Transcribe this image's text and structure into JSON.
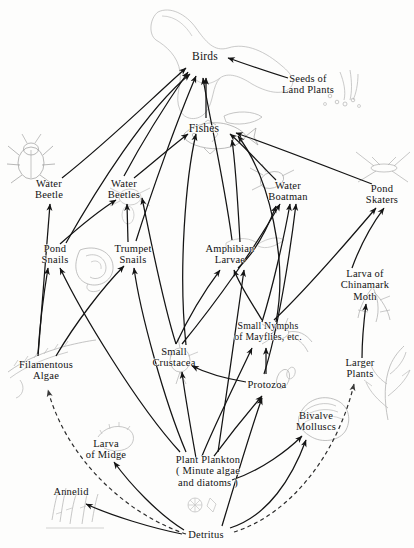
{
  "figure": {
    "background_color": "#fdfdfc",
    "ink_color": "#131313",
    "width": 414,
    "height": 548
  },
  "nodes": [
    {
      "id": "birds",
      "label": "Birds",
      "x": 205,
      "y": 56,
      "size": "lg"
    },
    {
      "id": "seeds",
      "label": "Seeds of\nLand Plants",
      "x": 308,
      "y": 84,
      "size": "md"
    },
    {
      "id": "fishes",
      "label": "Fishes",
      "x": 204,
      "y": 128,
      "size": "lg"
    },
    {
      "id": "water-beetle",
      "label": "Water\nBeetle",
      "x": 49,
      "y": 189,
      "size": "md"
    },
    {
      "id": "water-beetles",
      "label": "Water\nBeetles",
      "x": 124,
      "y": 189,
      "size": "md"
    },
    {
      "id": "water-boatman",
      "label": "Water\nBoatman",
      "x": 288,
      "y": 191,
      "size": "md"
    },
    {
      "id": "pond-skaters",
      "label": "Pond\nSkaters",
      "x": 382,
      "y": 194,
      "size": "md"
    },
    {
      "id": "pond-snails",
      "label": "Pond\nSnails",
      "x": 55,
      "y": 254,
      "size": "md"
    },
    {
      "id": "trumpet-snails",
      "label": "Trumpet\nSnails",
      "x": 133,
      "y": 254,
      "size": "md"
    },
    {
      "id": "amphibian-larvae",
      "label": "Amphibian\nLarvae",
      "x": 230,
      "y": 254,
      "size": "md"
    },
    {
      "id": "chinamark-moth",
      "label": "Larva of\nChinamark\nMoth",
      "x": 365,
      "y": 285,
      "size": "md"
    },
    {
      "id": "mayfly-nymphs",
      "label": "Small Nymphs\nof Mayflies, etc.",
      "x": 268,
      "y": 332,
      "size": "sm"
    },
    {
      "id": "filamentous-algae",
      "label": "Filamentous\nAlgae",
      "x": 46,
      "y": 370,
      "size": "md"
    },
    {
      "id": "small-crustacea",
      "label": "Small\nCrustacea",
      "x": 174,
      "y": 357,
      "size": "md"
    },
    {
      "id": "protozoa",
      "label": "Protozoa",
      "x": 267,
      "y": 385,
      "size": "md"
    },
    {
      "id": "larger-plants",
      "label": "Larger Plants",
      "x": 360,
      "y": 368,
      "size": "md"
    },
    {
      "id": "bivalve-molluscs",
      "label": "Bivalve\nMolluscs",
      "x": 316,
      "y": 421,
      "size": "md"
    },
    {
      "id": "larva-of-midge",
      "label": "Larva\nof Midge",
      "x": 106,
      "y": 449,
      "size": "md"
    },
    {
      "id": "plant-plankton",
      "label": "Plant Plankton\n( Minute algae\nand diatoms )",
      "x": 208,
      "y": 471,
      "size": "md"
    },
    {
      "id": "annelid",
      "label": "Annelid",
      "x": 71,
      "y": 492,
      "size": "md"
    },
    {
      "id": "detritus",
      "label": "Detritus",
      "x": 206,
      "y": 535,
      "size": "md"
    }
  ],
  "illustrations": [
    {
      "id": "bird-illustration",
      "name": "flying-bird-drawing",
      "x": 212,
      "y": 55
    },
    {
      "id": "seeds-illustration",
      "name": "seeds-drawing",
      "x": 344,
      "y": 92
    },
    {
      "id": "fish-illustration",
      "name": "fish-drawing",
      "x": 212,
      "y": 133
    },
    {
      "id": "water-beetle-illustration",
      "name": "beetle-drawing",
      "x": 31,
      "y": 160
    },
    {
      "id": "water-beetles-illustration",
      "name": "beetle-drawing",
      "x": 130,
      "y": 196
    },
    {
      "id": "water-boatman-illustration",
      "name": "water-boatman-drawing",
      "x": 273,
      "y": 180
    },
    {
      "id": "pond-skater-illustration",
      "name": "pond-skater-drawing",
      "x": 383,
      "y": 166
    },
    {
      "id": "snail-illustration",
      "name": "snail-shell-drawing",
      "x": 95,
      "y": 262
    },
    {
      "id": "amphibian-illustration",
      "name": "tadpole-drawing",
      "x": 243,
      "y": 245
    },
    {
      "id": "chinamark-illustration",
      "name": "moth-larva-drawing",
      "x": 372,
      "y": 300
    },
    {
      "id": "mayfly-illustration",
      "name": "mayfly-nymph-drawing",
      "x": 282,
      "y": 334
    },
    {
      "id": "algae-illustration",
      "name": "filamentous-algae-drawing",
      "x": 50,
      "y": 362
    },
    {
      "id": "crustacea-illustration",
      "name": "water-flea-drawing",
      "x": 180,
      "y": 362
    },
    {
      "id": "protozoa-illustration",
      "name": "protozoa-drawing",
      "x": 283,
      "y": 380
    },
    {
      "id": "larger-plants-illustration",
      "name": "pondweed-drawing",
      "x": 385,
      "y": 388
    },
    {
      "id": "mollusc-illustration",
      "name": "bivalve-shell-drawing",
      "x": 323,
      "y": 416
    },
    {
      "id": "midge-illustration",
      "name": "midge-larva-drawing",
      "x": 114,
      "y": 435
    },
    {
      "id": "diatom-illustration",
      "name": "diatom-drawing",
      "x": 197,
      "y": 505
    },
    {
      "id": "annelid-illustration",
      "name": "worm-tubes-drawing",
      "x": 73,
      "y": 512
    }
  ],
  "links": [
    {
      "from": "water-beetle",
      "to": "birds",
      "style": "solid"
    },
    {
      "from": "water-beetles",
      "to": "birds",
      "style": "solid"
    },
    {
      "from": "pond-snails",
      "to": "birds",
      "style": "solid"
    },
    {
      "from": "trumpet-snails",
      "to": "birds",
      "style": "solid"
    },
    {
      "from": "amphibian-larvae",
      "to": "birds",
      "style": "solid"
    },
    {
      "from": "fishes",
      "to": "birds",
      "style": "solid"
    },
    {
      "from": "seeds",
      "to": "birds",
      "style": "solid"
    },
    {
      "from": "water-beetles",
      "to": "fishes",
      "style": "solid"
    },
    {
      "from": "water-boatman",
      "to": "fishes",
      "style": "solid"
    },
    {
      "from": "pond-skaters",
      "to": "fishes",
      "style": "solid"
    },
    {
      "from": "amphibian-larvae",
      "to": "fishes",
      "style": "solid"
    },
    {
      "from": "mayfly-nymphs",
      "to": "fishes",
      "style": "solid"
    },
    {
      "from": "small-crustacea",
      "to": "fishes",
      "style": "solid"
    },
    {
      "from": "filamentous-algae",
      "to": "water-beetle",
      "style": "solid"
    },
    {
      "from": "pond-snails",
      "to": "water-beetles",
      "style": "solid"
    },
    {
      "from": "trumpet-snails",
      "to": "water-beetles",
      "style": "solid"
    },
    {
      "from": "small-crustacea",
      "to": "water-beetles",
      "style": "solid"
    },
    {
      "from": "amphibian-larvae",
      "to": "water-boatman",
      "style": "solid"
    },
    {
      "from": "small-crustacea",
      "to": "water-boatman",
      "style": "solid"
    },
    {
      "from": "mayfly-nymphs",
      "to": "water-boatman",
      "style": "solid"
    },
    {
      "from": "protozoa",
      "to": "water-boatman",
      "style": "solid"
    },
    {
      "from": "mayfly-nymphs",
      "to": "pond-skaters",
      "style": "solid"
    },
    {
      "from": "chinamark-moth",
      "to": "pond-skaters",
      "style": "solid"
    },
    {
      "from": "filamentous-algae",
      "to": "pond-snails",
      "style": "solid"
    },
    {
      "from": "plant-plankton",
      "to": "pond-snails",
      "style": "solid"
    },
    {
      "from": "filamentous-algae",
      "to": "trumpet-snails",
      "style": "solid"
    },
    {
      "from": "plant-plankton",
      "to": "trumpet-snails",
      "style": "solid"
    },
    {
      "from": "small-crustacea",
      "to": "amphibian-larvae",
      "style": "solid"
    },
    {
      "from": "mayfly-nymphs",
      "to": "amphibian-larvae",
      "style": "solid"
    },
    {
      "from": "plant-plankton",
      "to": "amphibian-larvae",
      "style": "solid"
    },
    {
      "from": "larger-plants",
      "to": "chinamark-moth",
      "style": "solid"
    },
    {
      "from": "plant-plankton",
      "to": "small-crustacea",
      "style": "solid"
    },
    {
      "from": "protozoa",
      "to": "small-crustacea",
      "style": "solid"
    },
    {
      "from": "plant-plankton",
      "to": "protozoa",
      "style": "solid"
    },
    {
      "from": "plant-plankton",
      "to": "mayfly-nymphs",
      "style": "solid"
    },
    {
      "from": "protozoa",
      "to": "mayfly-nymphs",
      "style": "solid"
    },
    {
      "from": "plant-plankton",
      "to": "bivalve-molluscs",
      "style": "solid"
    },
    {
      "from": "detritus",
      "to": "bivalve-molluscs",
      "style": "solid"
    },
    {
      "from": "detritus",
      "to": "larva-of-midge",
      "style": "solid"
    },
    {
      "from": "detritus",
      "to": "annelid",
      "style": "solid"
    },
    {
      "from": "detritus",
      "to": "protozoa",
      "style": "solid"
    },
    {
      "from": "detritus",
      "to": "filamentous-algae",
      "style": "dashed"
    },
    {
      "from": "detritus",
      "to": "larger-plants",
      "style": "dashed"
    }
  ]
}
